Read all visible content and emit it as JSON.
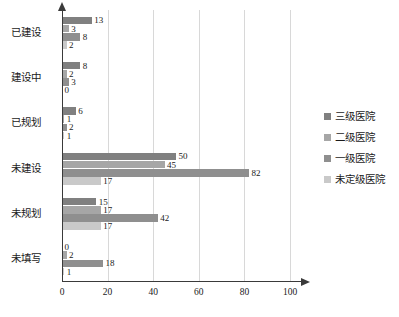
{
  "chart_data": {
    "type": "bar",
    "orientation": "horizontal",
    "title": "",
    "xlabel": "",
    "ylabel": "",
    "xlim": [
      0,
      100
    ],
    "xticks": [
      0,
      20,
      40,
      60,
      80,
      100
    ],
    "grid": "vertical",
    "legend_position": "right",
    "categories": [
      "已建设",
      "建设中",
      "已规划",
      "未建设",
      "未规划",
      "未填写"
    ],
    "series": [
      {
        "name": "三级医院",
        "color": "#808080",
        "values": [
          13,
          8,
          6,
          50,
          15,
          0
        ]
      },
      {
        "name": "二级医院",
        "color": "#a6a6a6",
        "values": [
          3,
          2,
          1,
          45,
          17,
          2
        ]
      },
      {
        "name": "一级医院",
        "color": "#8f8f8f",
        "values": [
          8,
          3,
          2,
          82,
          42,
          18
        ]
      },
      {
        "name": "未定级医院",
        "color": "#c9c9c9",
        "values": [
          2,
          0,
          1,
          17,
          17,
          1
        ]
      }
    ]
  },
  "axis": {
    "tick_labels": [
      "0",
      "20",
      "40",
      "60",
      "80",
      "100"
    ]
  },
  "legend": {
    "items": [
      {
        "label": "三级医院",
        "color": "#808080"
      },
      {
        "label": "二级医院",
        "color": "#a6a6a6"
      },
      {
        "label": "一级医院",
        "color": "#8f8f8f"
      },
      {
        "label": "未定级医院",
        "color": "#c9c9c9"
      }
    ]
  }
}
